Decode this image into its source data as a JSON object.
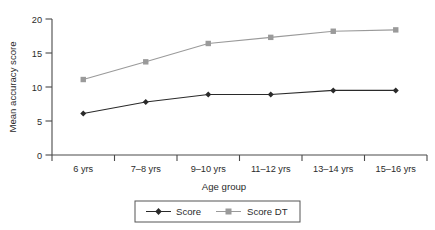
{
  "chart_data": {
    "type": "line",
    "title": "",
    "xlabel": "Age group",
    "ylabel": "Mean accuracy score",
    "categories": [
      "6 yrs",
      "7–8 yrs",
      "9–10 yrs",
      "11–12 yrs",
      "13–14 yrs",
      "15–16 yrs"
    ],
    "series": [
      {
        "name": "Score",
        "values": [
          6.1,
          7.8,
          8.9,
          8.9,
          9.5,
          9.5
        ],
        "color": "#2a2a2a",
        "marker": "diamond"
      },
      {
        "name": "Score DT",
        "values": [
          11.1,
          13.7,
          16.4,
          17.3,
          18.2,
          18.4
        ],
        "color": "#9a9a9a",
        "marker": "square"
      }
    ],
    "ylim": [
      0,
      20
    ],
    "yticks": [
      0,
      5,
      10,
      15,
      20
    ],
    "ytick_labels": [
      "0",
      "5",
      "10",
      "15",
      "20"
    ],
    "grid": false,
    "legend_position": "bottom"
  },
  "axes": {
    "y_label": "Mean accuracy score",
    "x_label": "Age group",
    "y_ticks": [
      "0",
      "5",
      "10",
      "15",
      "20"
    ],
    "x_ticks": [
      "6 yrs",
      "7–8 yrs",
      "9–10 yrs",
      "11–12 yrs",
      "13–14 yrs",
      "15–16 yrs"
    ]
  },
  "legend": {
    "items": [
      {
        "label": "Score",
        "color": "#2a2a2a",
        "marker": "diamond"
      },
      {
        "label": "Score DT",
        "color": "#9a9a9a",
        "marker": "square"
      }
    ]
  },
  "colors": {
    "series_score": "#2a2a2a",
    "series_score_dt": "#9a9a9a",
    "axis": "#4a4a4a",
    "text": "#2b2b2b",
    "background": "#ffffff"
  }
}
